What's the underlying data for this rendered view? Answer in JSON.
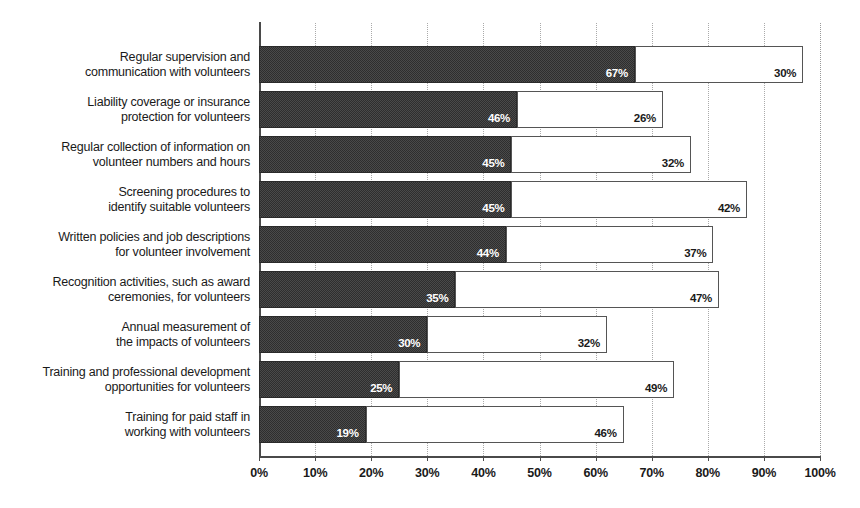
{
  "chart_data": {
    "type": "bar",
    "orientation": "horizontal",
    "stacked": true,
    "title": "",
    "subtitle": "",
    "xlabel": "",
    "ylabel": "",
    "xlim": [
      0,
      100
    ],
    "grid": true,
    "legend_position": "none",
    "axis_tick_labels": [
      "0%",
      "10%",
      "20%",
      "30%",
      "40%",
      "50%",
      "60%",
      "70%",
      "80%",
      "90%",
      "100%"
    ],
    "axis_tick_values": [
      0,
      10,
      20,
      30,
      40,
      50,
      60,
      70,
      80,
      90,
      100
    ],
    "categories": [
      "Regular supervision and communication with volunteers",
      "Liability coverage or insurance protection for volunteers",
      "Regular collection of information on volunteer numbers and hours",
      "Screening procedures to identify suitable volunteers",
      "Written policies and job descriptions for volunteer involvement",
      "Recognition activities, such as award ceremonies, for volunteers",
      "Annual measurement of the impacts of volunteers",
      "Training and professional development opportunities for volunteers",
      "Training for paid staff in working with volunteers"
    ],
    "category_lines": [
      [
        "Regular supervision and",
        "communication with volunteers"
      ],
      [
        "Liability coverage or insurance",
        "protection for volunteers"
      ],
      [
        "Regular collection of information on",
        "volunteer numbers and hours"
      ],
      [
        "Screening procedures to",
        "identify suitable volunteers"
      ],
      [
        "Written policies and job descriptions",
        "for volunteer involvement"
      ],
      [
        "Recognition activities, such as award",
        "ceremonies, for volunteers"
      ],
      [
        "Annual measurement of",
        "the impacts of volunteers"
      ],
      [
        "Training and professional development",
        "opportunities for volunteers"
      ],
      [
        "Training for paid staff in",
        "working with volunteers"
      ]
    ],
    "series": [
      {
        "name": "dark-segment",
        "color": "#3b3b3b",
        "values": [
          67,
          46,
          45,
          45,
          44,
          35,
          30,
          25,
          19
        ],
        "labels": [
          "67%",
          "46%",
          "45%",
          "45%",
          "44%",
          "35%",
          "30%",
          "25%",
          "19%"
        ]
      },
      {
        "name": "light-segment",
        "color": "#ffffff",
        "values": [
          30,
          26,
          32,
          42,
          37,
          47,
          32,
          49,
          46
        ],
        "labels": [
          "30%",
          "26%",
          "32%",
          "42%",
          "37%",
          "47%",
          "32%",
          "49%",
          "46%"
        ]
      }
    ]
  },
  "style": {
    "axis_color": "#4a4a4a",
    "gridline_color": "#aaaaaa",
    "dark_fill": "#3b3b3b",
    "light_fill": "#ffffff",
    "light_stroke": "#555555",
    "text_color": "#1a1a1a",
    "dark_value_text": "#ffffff"
  }
}
